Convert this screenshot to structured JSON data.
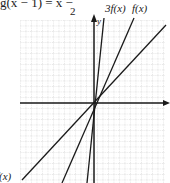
{
  "equation_fragment": {
    "text": "g(x − 1) = x − ",
    "denominator": "2"
  },
  "axes": {
    "x_label": "x",
    "y_label": "y"
  },
  "line_labels": {
    "steep": "3f(x)",
    "medium": "f(x)",
    "shallow": "f(x)"
  },
  "colors": {
    "line": "#1a1a1a",
    "grid": "#b5b5b5"
  }
}
